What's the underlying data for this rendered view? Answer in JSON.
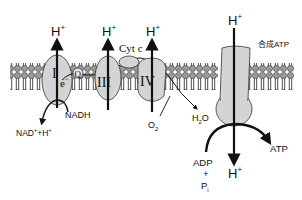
{
  "diagram": {
    "colors": {
      "protein_fill": "#d4d4d4",
      "lipid_head": "#9a9a9a",
      "stroke": "#111111",
      "background": "#ffffff"
    },
    "complexes": {
      "c1": {
        "label": "I",
        "proton": "H",
        "proton_sup": "+"
      },
      "q": {
        "label": "Q"
      },
      "c3": {
        "label": "III",
        "proton": "H",
        "proton_sup": "+"
      },
      "cytc": {
        "label": "Cyt c"
      },
      "c4": {
        "label": "IV",
        "proton": "H",
        "proton_sup": "+"
      },
      "atp_synthase": {
        "label": "合成ATP",
        "proton_in": "H",
        "proton_in_sup": "+",
        "proton_out": "H",
        "proton_out_sup": "+"
      }
    },
    "electron": {
      "label": "e",
      "sup": "−"
    },
    "substrates": {
      "nadh": "NADH",
      "nad": "NAD",
      "nad_sup": "+",
      "nad_plus": "+H",
      "nad_plus_sup": "+",
      "o2": "O",
      "o2_sub": "2",
      "h2o_h": "H",
      "h2o_sub": "2",
      "h2o_o": "O",
      "adp": "ADP",
      "plus": "+",
      "pi": "P",
      "pi_sub": "i",
      "atp": "ATP"
    }
  }
}
